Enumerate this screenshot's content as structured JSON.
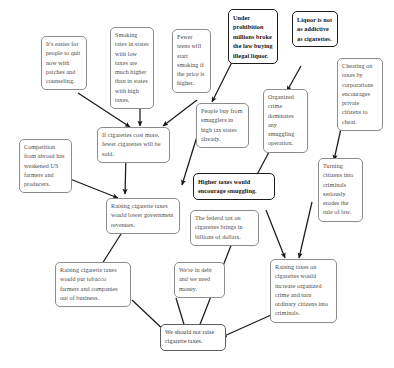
{
  "diagram": {
    "nodes": [
      {
        "id": "patches",
        "text": "It's easier for people to quit now with patches and counseling."
      },
      {
        "id": "rates",
        "text": "Smoking rates in states with low taxes are much higher than in states with high taxes."
      },
      {
        "id": "teens",
        "text": "Fewer teens will start smoking if the price is higher."
      },
      {
        "id": "prohibition",
        "text": "Under prohibition millions broke the law buying illegal liquor."
      },
      {
        "id": "liquor",
        "text": "Liquor is not as addictive as cigarettes."
      },
      {
        "id": "cheating",
        "text": "Cheating on taxes by corporations encourages private citizens to cheat."
      },
      {
        "id": "smugglers",
        "text": "People buy from smugglers in high tax states already."
      },
      {
        "id": "orgcrime",
        "text": "Organized crime dominates any smuggling operation."
      },
      {
        "id": "costmore",
        "text": "If cigarettes cost more, fewer cigarettes will be sold."
      },
      {
        "id": "competition",
        "text": "Competition from abroad has weakened US farmers and producers."
      },
      {
        "id": "lowerrev",
        "text": "Raising cigarette taxes would lower government revenues."
      },
      {
        "id": "smuggling",
        "text": "Higher taxes would encourage smuggling."
      },
      {
        "id": "federaltax",
        "text": "The federal tax on cigarettes brings in billions of dollars."
      },
      {
        "id": "ruleoflaw",
        "text": "Turning citizens into criminals seriously erodes the rule of law."
      },
      {
        "id": "criminals",
        "text": "Raising taxes on cigarettes would increase organized crime and turn ordinary citizens into criminals."
      },
      {
        "id": "farmers",
        "text": "Raising cigarette taxes would put tobacco farmers and companies out of business."
      },
      {
        "id": "debt",
        "text": "We're in debt and we need money."
      },
      {
        "id": "conclusion",
        "text": "We should not raise cigarette taxes."
      }
    ],
    "colors": {
      "box_border": "#8d8d8d",
      "claim_border": "#1c1c1c",
      "arrow": "#1a1a1a",
      "text": "#4a4a4a",
      "background": "#ffffff"
    }
  }
}
